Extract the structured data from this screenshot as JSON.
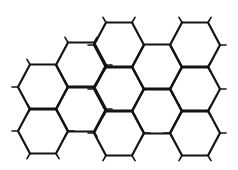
{
  "diagram": {
    "title": "",
    "stroke_color": "#141414",
    "background_color": "#ffffff",
    "hex_geometry": {
      "half_width": 25,
      "top_edge_half_length": 13,
      "half_height": 22.5,
      "column_spacing": 38
    },
    "hexagons": [
      {
        "col": 0,
        "cx": 43,
        "cy": 87
      },
      {
        "col": 0,
        "cx": 43,
        "cy": 131
      },
      {
        "col": 1,
        "cx": 81,
        "cy": 65
      },
      {
        "col": 1,
        "cx": 81,
        "cy": 109
      },
      {
        "col": 2,
        "cx": 119,
        "cy": 45
      },
      {
        "col": 2,
        "cx": 119,
        "cy": 89
      },
      {
        "col": 2,
        "cx": 119,
        "cy": 133
      },
      {
        "col": 3,
        "cx": 157,
        "cy": 67
      },
      {
        "col": 3,
        "cx": 157,
        "cy": 111
      },
      {
        "col": 4,
        "cx": 195,
        "cy": 45
      },
      {
        "col": 4,
        "cx": 195,
        "cy": 89
      },
      {
        "col": 4,
        "cx": 195,
        "cy": 133
      }
    ],
    "hexagon_count": 12
  }
}
